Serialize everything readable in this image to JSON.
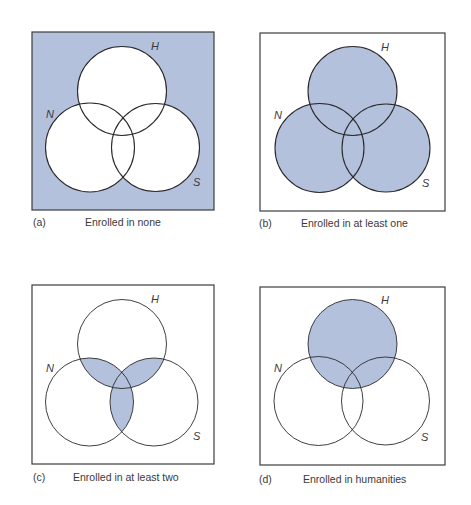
{
  "figure": {
    "shade_color": "#b4c1dd",
    "stroke_color": "#2a2a2a",
    "background": "#ffffff",
    "set_labels": {
      "H": "H",
      "N": "N",
      "S": "S"
    }
  },
  "panels": [
    {
      "id": "a",
      "letter": "(a)",
      "caption": "Enrolled in none",
      "shading": "complement",
      "frame": {
        "x": 32,
        "y": 32,
        "w": 182,
        "h": 178
      },
      "circles": {
        "H": [
          122,
          91,
          44.5
        ],
        "N": [
          90,
          147.5,
          44.5
        ],
        "S": [
          155.5,
          147.5,
          44
        ]
      },
      "labels": {
        "H": [
          151,
          50
        ],
        "N": [
          46,
          118
        ],
        "S": [
          193,
          186
        ]
      },
      "caption_pos": {
        "letter_x": 33,
        "text_x": 85,
        "y": 216
      }
    },
    {
      "id": "b",
      "letter": "(b)",
      "caption": "Enrolled in at least one",
      "shading": "union",
      "frame": {
        "x": 260,
        "y": 33,
        "w": 185,
        "h": 178
      },
      "circles": {
        "H": [
          352.5,
          91,
          44.5
        ],
        "N": [
          319.5,
          148,
          44.5
        ],
        "S": [
          386,
          148,
          44
        ]
      },
      "labels": {
        "H": [
          381,
          51
        ],
        "N": [
          274,
          119
        ],
        "S": [
          422,
          187
        ]
      },
      "caption_pos": {
        "letter_x": 259,
        "text_x": 301,
        "y": 217
      }
    },
    {
      "id": "c",
      "letter": "(c)",
      "caption": "Enrolled in at least two",
      "shading": "at_least_two",
      "frame": {
        "x": 32,
        "y": 285,
        "w": 182,
        "h": 179
      },
      "circles": {
        "H": [
          122,
          344,
          44.5
        ],
        "N": [
          89.5,
          402,
          44
        ],
        "S": [
          154,
          402,
          44
        ]
      },
      "labels": {
        "H": [
          151,
          303
        ],
        "N": [
          46,
          372
        ],
        "S": [
          193,
          440
        ]
      },
      "caption_pos": {
        "letter_x": 33,
        "text_x": 73,
        "y": 471
      }
    },
    {
      "id": "d",
      "letter": "(d)",
      "caption": "Enrolled in humanities",
      "shading": "H_only_set",
      "frame": {
        "x": 260,
        "y": 287,
        "w": 185,
        "h": 178
      },
      "circles": {
        "H": [
          352.5,
          344,
          44.5
        ],
        "N": [
          318.5,
          401,
          44.5
        ],
        "S": [
          385.5,
          401,
          44
        ]
      },
      "labels": {
        "H": [
          381,
          304
        ],
        "N": [
          274,
          372
        ],
        "S": [
          421,
          441
        ]
      },
      "caption_pos": {
        "letter_x": 259,
        "text_x": 303,
        "y": 473
      }
    }
  ]
}
